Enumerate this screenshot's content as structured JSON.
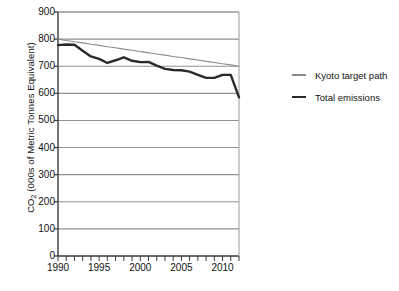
{
  "chart_data": {
    "type": "line",
    "title": "",
    "xlabel": "",
    "ylabel": "CO2 (000s of Metric Tonnes Equivalent)",
    "ylabel_prefix": "CO",
    "ylabel_sub": "2",
    "ylabel_suffix": " (000s of Metric Tonnes Equivalent)",
    "xlim": [
      1990,
      2012
    ],
    "ylim": [
      0,
      900
    ],
    "ytick_values": [
      0,
      100,
      200,
      300,
      400,
      500,
      600,
      700,
      800,
      900
    ],
    "ytick_labels": [
      "0",
      "100",
      "200",
      "300",
      "400",
      "500",
      "600",
      "700",
      "800",
      "900"
    ],
    "xtick_values": [
      1990,
      1995,
      2000,
      2005,
      2010
    ],
    "xtick_labels": [
      "1990",
      "1995",
      "2000",
      "2005",
      "2010"
    ],
    "x_minor_ticks": [
      1990,
      1991,
      1992,
      1993,
      1994,
      1995,
      1996,
      1997,
      1998,
      1999,
      2000,
      2001,
      2002,
      2003,
      2004,
      2005,
      2006,
      2007,
      2008,
      2009,
      2010,
      2011,
      2012
    ],
    "grid": "horizontal",
    "legend_position": "right",
    "x": [
      1990,
      1991,
      1992,
      1993,
      1994,
      1995,
      1996,
      1997,
      1998,
      1999,
      2000,
      2001,
      2002,
      2003,
      2004,
      2005,
      2006,
      2007,
      2008,
      2009,
      2010,
      2011,
      2012
    ],
    "series": [
      {
        "name": "Kyoto target path",
        "color": "#8a8a8a",
        "width": 1.1,
        "values": [
          800,
          795,
          790,
          786,
          781,
          777,
          772,
          768,
          763,
          759,
          754,
          750,
          745,
          741,
          736,
          732,
          727,
          723,
          718,
          714,
          709,
          705,
          700
        ]
      },
      {
        "name": "Total emissions",
        "color": "#2a2a2a",
        "width": 2.4,
        "values": [
          778,
          780,
          779,
          757,
          736,
          727,
          712,
          722,
          733,
          720,
          715,
          716,
          702,
          690,
          686,
          685,
          680,
          668,
          657,
          657,
          668,
          668,
          585
        ]
      }
    ]
  },
  "legend": {
    "items": [
      {
        "label": "Kyoto target path"
      },
      {
        "label": "Total emissions"
      }
    ]
  }
}
